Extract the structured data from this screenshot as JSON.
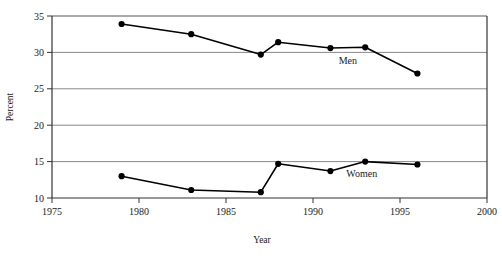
{
  "chart_data": {
    "type": "line",
    "title": "",
    "xlabel": "Year",
    "ylabel": "Percent",
    "xlim": [
      1975,
      2000
    ],
    "ylim": [
      10,
      35
    ],
    "xticks": [
      1975,
      1980,
      1985,
      1990,
      1995,
      2000
    ],
    "yticks": [
      10,
      15,
      20,
      25,
      30,
      35
    ],
    "xtick_labels": [
      "1975",
      "1980",
      "1985",
      "1990",
      "1995",
      "2000"
    ],
    "ytick_labels": [
      "10",
      "15",
      "20",
      "25",
      "30",
      "35"
    ],
    "grid": "horizontal",
    "legend_position": "inline-annotation",
    "series": [
      {
        "name": "Men",
        "label": "Men",
        "color": "#000000",
        "marker": "filled-circle",
        "x": [
          1979,
          1983,
          1987,
          1988,
          1991,
          1993,
          1996
        ],
        "values": [
          33.9,
          32.5,
          29.7,
          31.4,
          30.6,
          30.7,
          27.1
        ]
      },
      {
        "name": "Women",
        "label": "Women",
        "color": "#000000",
        "marker": "filled-circle",
        "x": [
          1979,
          1983,
          1987,
          1988,
          1991,
          1993,
          1996
        ],
        "values": [
          13.0,
          11.1,
          10.8,
          14.7,
          13.7,
          15.0,
          14.6
        ]
      }
    ],
    "annotations": [
      {
        "text": "Men",
        "x": 1992.0,
        "y": 28.4
      },
      {
        "text": "Women",
        "x": 1992.8,
        "y": 12.9
      }
    ]
  },
  "axes": {
    "y_axis_title": "Percent",
    "x_axis_title": "Year"
  }
}
